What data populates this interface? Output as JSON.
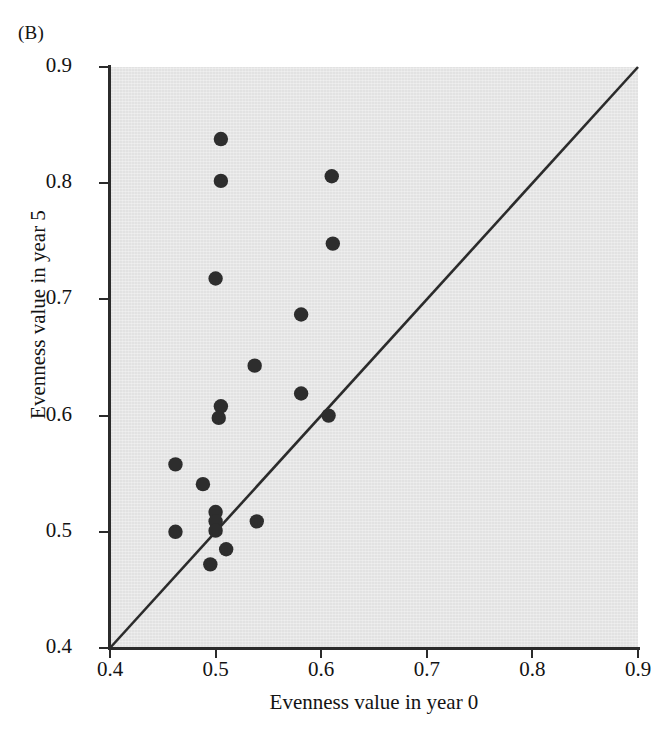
{
  "panel": {
    "label": "(B)"
  },
  "chart_data": {
    "type": "scatter",
    "title": "",
    "xlabel": "Evenness value in year 0",
    "ylabel": "Evenness value in year 5",
    "xlim": [
      0.4,
      0.9
    ],
    "ylim": [
      0.4,
      0.9
    ],
    "xticks": [
      "0.4",
      "0.5",
      "0.6",
      "0.7",
      "0.8",
      "0.9"
    ],
    "yticks": [
      "0.4",
      "0.5",
      "0.6",
      "0.7",
      "0.8",
      "0.9"
    ],
    "xtick_values": [
      0.4,
      0.5,
      0.6,
      0.7,
      0.8,
      0.9
    ],
    "ytick_values": [
      0.4,
      0.5,
      0.6,
      0.7,
      0.8,
      0.9
    ],
    "grid": false,
    "legend": null,
    "plot_background": "#e2e2e2",
    "marker_color": "#2d2d2d",
    "line_color": "#2b2b2b",
    "reference_line": {
      "name": "one-to-one line",
      "from": [
        0.4,
        0.4
      ],
      "to": [
        0.9,
        0.9
      ]
    },
    "points": [
      {
        "x": 0.505,
        "y": 0.838
      },
      {
        "x": 0.505,
        "y": 0.802
      },
      {
        "x": 0.61,
        "y": 0.806
      },
      {
        "x": 0.611,
        "y": 0.748
      },
      {
        "x": 0.5,
        "y": 0.718
      },
      {
        "x": 0.581,
        "y": 0.687
      },
      {
        "x": 0.537,
        "y": 0.643
      },
      {
        "x": 0.581,
        "y": 0.619
      },
      {
        "x": 0.505,
        "y": 0.608
      },
      {
        "x": 0.503,
        "y": 0.598
      },
      {
        "x": 0.607,
        "y": 0.6
      },
      {
        "x": 0.462,
        "y": 0.558
      },
      {
        "x": 0.488,
        "y": 0.541
      },
      {
        "x": 0.5,
        "y": 0.517
      },
      {
        "x": 0.5,
        "y": 0.509
      },
      {
        "x": 0.5,
        "y": 0.501
      },
      {
        "x": 0.462,
        "y": 0.5
      },
      {
        "x": 0.539,
        "y": 0.509
      },
      {
        "x": 0.51,
        "y": 0.485
      },
      {
        "x": 0.495,
        "y": 0.472
      }
    ]
  }
}
